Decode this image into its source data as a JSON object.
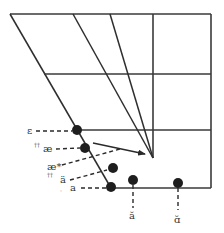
{
  "diagram": {
    "type": "vowel-quadrilateral",
    "colors": {
      "line": "#3a3a3a",
      "dot": "#1e1e1e",
      "text": "#333333",
      "background": "#ffffff"
    },
    "frame": {
      "top_left": [
        10,
        14
      ],
      "top_right": [
        211,
        14
      ],
      "bottom_right": [
        211,
        188
      ],
      "bottom_left": [
        111,
        188
      ]
    },
    "horizontal_lines": [
      {
        "from": [
          44,
          74
        ],
        "to": [
          211,
          74
        ]
      },
      {
        "from": [
          77,
          130
        ],
        "to": [
          211,
          130
        ]
      }
    ],
    "vertical_lines": [
      {
        "from": [
          153,
          14
        ],
        "to": [
          153,
          158
        ]
      }
    ],
    "converging_lines": [
      {
        "from": [
          73,
          14
        ],
        "to": [
          153,
          158
        ]
      },
      {
        "from": [
          110,
          14
        ],
        "to": [
          153,
          158
        ]
      }
    ],
    "vowels": [
      {
        "id": "epsilon",
        "symbol": "ε",
        "marks": "",
        "dot": [
          77,
          130
        ],
        "label_pos": [
          27,
          134
        ],
        "leader": "horizontal"
      },
      {
        "id": "ae",
        "symbol": "æ",
        "marks": "††",
        "dot": [
          85,
          148
        ],
        "label_pos": [
          43,
          152
        ],
        "leader": "horizontal"
      },
      {
        "id": "ae-star",
        "symbol": "æ*",
        "marks": "",
        "dot": null,
        "label_pos": [
          45,
          170
        ],
        "leader": "diagonal"
      },
      {
        "id": "a-umlaut",
        "symbol": "ä",
        "marks": "††",
        "dot": [
          113,
          168
        ],
        "label_pos": [
          59,
          183
        ],
        "leader": "diagonal"
      },
      {
        "id": "a",
        "symbol": "a",
        "marks": "·",
        "dot": [
          111,
          187
        ],
        "label_pos": [
          70,
          191
        ],
        "leader": "horizontal"
      },
      {
        "id": "a-breve",
        "symbol": "ă",
        "marks": "",
        "dot": [
          133,
          180
        ],
        "label_pos": [
          129,
          218
        ],
        "leader": "vertical"
      },
      {
        "id": "a-back-breve",
        "symbol": "ɑ̆",
        "marks": "",
        "dot": [
          178,
          183
        ],
        "label_pos": [
          174,
          222
        ],
        "leader": "vertical"
      }
    ],
    "arrow": {
      "from": [
        93,
        143
      ],
      "to": [
        147,
        155
      ],
      "label": "shift"
    }
  }
}
